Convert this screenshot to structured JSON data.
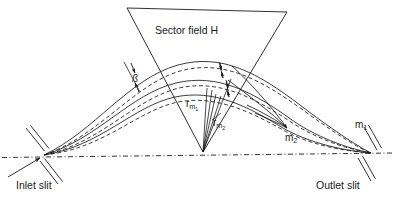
{
  "figure": {
    "type": "schematic-diagram",
    "background_color": "#ffffff",
    "line_color": "#1a1a1a"
  },
  "labels": {
    "sector_field": "Sector field H",
    "inlet_slit": "Inlet slit",
    "outlet_slit": "Outlet slit",
    "beta": "ß",
    "radius_m1_symbol": "r",
    "radius_m1_sub": "m",
    "radius_m1_subsub": "1",
    "radius_m2_symbol": "r",
    "radius_m2_sub": "m",
    "radius_m2_subsub": "2",
    "mass_1_symbol": "m",
    "mass_1_sub": "1",
    "mass_2_symbol": "m",
    "mass_2_sub": "2"
  },
  "geometry": {
    "inlet_slit_point": [
      44,
      155
    ],
    "outlet_slit_point": [
      371,
      153
    ],
    "sector_apex": [
      203,
      152
    ],
    "sector_top_left": [
      127,
      8
    ],
    "sector_top_right": [
      287,
      12
    ],
    "focus_m2_point": [
      288,
      130
    ],
    "axis_left": [
      2,
      157
    ],
    "axis_right": [
      394,
      153
    ]
  },
  "colors": {
    "stroke": "#1a1a1a",
    "text": "#1a1a1a",
    "background": "#ffffff"
  }
}
